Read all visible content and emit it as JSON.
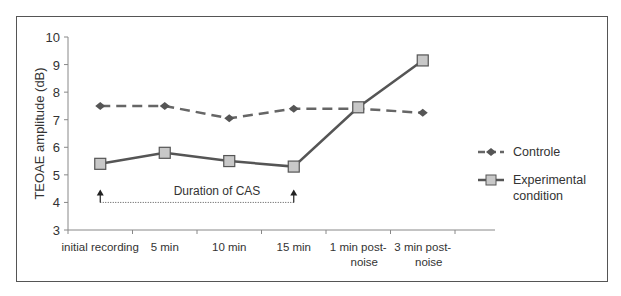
{
  "chart_data": {
    "type": "line",
    "title": "",
    "xlabel": "",
    "ylabel": "TEOAE amplitude (dB)",
    "ylim": [
      3,
      10
    ],
    "yticks": [
      3,
      4,
      5,
      6,
      7,
      8,
      9,
      10
    ],
    "categories": [
      "initial recording",
      "5 min",
      "10 min",
      "15 min",
      "1 min post-noise",
      "3 min post-noise"
    ],
    "category_lines": [
      [
        "initial recording"
      ],
      [
        "5 min"
      ],
      [
        "10 min"
      ],
      [
        "15 min"
      ],
      [
        "1 min post-",
        "noise"
      ],
      [
        "3 min post-",
        "noise"
      ]
    ],
    "series": [
      {
        "name": "Controle",
        "style": "dashed",
        "marker": "diamond",
        "color": "#666666",
        "values": [
          7.5,
          7.5,
          7.05,
          7.4,
          7.4,
          7.25
        ]
      },
      {
        "name": "Experimental condition",
        "style": "solid",
        "marker": "square",
        "color": "#555555",
        "values": [
          5.4,
          5.8,
          5.5,
          5.3,
          7.45,
          9.15
        ]
      }
    ],
    "legend": {
      "position": "right",
      "entries": [
        [
          "Controle"
        ],
        [
          "Experimental",
          "condition"
        ]
      ]
    },
    "annotations": [
      {
        "text": "Duration of CAS",
        "from": "initial recording",
        "to": "15 min",
        "y": 4
      }
    ],
    "grid": false
  }
}
